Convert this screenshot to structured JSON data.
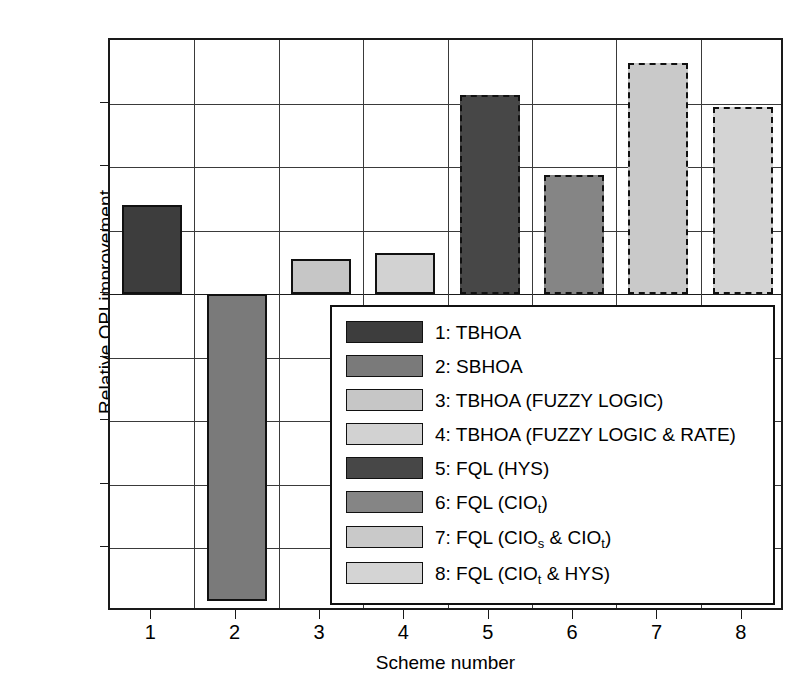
{
  "chart_data": {
    "type": "bar",
    "title": "",
    "xlabel": "Scheme number",
    "ylabel": "Relative OPI improvement",
    "categories": [
      "1",
      "2",
      "3",
      "4",
      "5",
      "6",
      "7",
      "8"
    ],
    "values": [
      0.141,
      -0.482,
      0.055,
      0.065,
      0.314,
      0.188,
      0.364,
      0.295
    ],
    "ylim": [
      -0.5,
      0.4
    ],
    "ytick_labels": [
      "0.4",
      "0.3",
      "0.2",
      "0.1",
      "0",
      "−0.1",
      "−0.2",
      "−0.3",
      "−0.4",
      "−0.5"
    ],
    "ytick_values": [
      0.4,
      0.3,
      0.2,
      0.1,
      0,
      -0.1,
      -0.2,
      -0.3,
      -0.4,
      -0.5
    ],
    "xtick_labels": [
      "1",
      "2",
      "3",
      "4",
      "5",
      "6",
      "7",
      "8"
    ],
    "grid": true,
    "legend_position": "inside-lower-right",
    "bar_styles": [
      {
        "fill": "#3d3d3d",
        "border": "solid"
      },
      {
        "fill": "#7a7a7a",
        "border": "solid"
      },
      {
        "fill": "#c6c6c6",
        "border": "solid"
      },
      {
        "fill": "#d2d2d2",
        "border": "solid"
      },
      {
        "fill": "#474747",
        "border": "dashed"
      },
      {
        "fill": "#858585",
        "border": "dashed"
      },
      {
        "fill": "#c9c9c9",
        "border": "dashed"
      },
      {
        "fill": "#d4d4d4",
        "border": "dashed"
      }
    ],
    "series": [
      {
        "name": "Relative OPI improvement",
        "values": [
          0.141,
          -0.482,
          0.055,
          0.065,
          0.314,
          0.188,
          0.364,
          0.295
        ]
      }
    ],
    "legend": [
      {
        "label": "1: TBHOA",
        "swatch": "#3d3d3d"
      },
      {
        "label": "2: SBHOA",
        "swatch": "#7a7a7a"
      },
      {
        "label": "3: TBHOA (FUZZY LOGIC)",
        "swatch": "#c6c6c6"
      },
      {
        "label": "4: TBHOA (FUZZY LOGIC & RATE)",
        "swatch": "#d2d2d2"
      },
      {
        "label": "5: FQL (HYS)",
        "swatch": "#474747"
      },
      {
        "label": "6: FQL (CIO_t)",
        "swatch": "#858585"
      },
      {
        "label": "7: FQL (CIO_s & CIO_t)",
        "swatch": "#c9c9c9"
      },
      {
        "label": "8: FQL (CIO_t & HYS)",
        "swatch": "#d4d4d4"
      }
    ]
  },
  "axes": {
    "ylabel": "Relative OPI improvement",
    "xlabel": "Scheme number",
    "yticks": [
      {
        "label": "0.4",
        "value": 0.4
      },
      {
        "label": "0.3",
        "value": 0.3
      },
      {
        "label": "0.2",
        "value": 0.2
      },
      {
        "label": "0.1",
        "value": 0.1
      },
      {
        "label": "0",
        "value": 0
      },
      {
        "label": "−0.1",
        "value": -0.1
      },
      {
        "label": "−0.2",
        "value": -0.2
      },
      {
        "label": "−0.3",
        "value": -0.3
      },
      {
        "label": "−0.4",
        "value": -0.4
      },
      {
        "label": "−0.5",
        "value": -0.5
      }
    ],
    "xticks": [
      {
        "label": "1"
      },
      {
        "label": "2"
      },
      {
        "label": "3"
      },
      {
        "label": "4"
      },
      {
        "label": "5"
      },
      {
        "label": "6"
      },
      {
        "label": "7"
      },
      {
        "label": "8"
      }
    ]
  },
  "legend": {
    "items": [
      {
        "num": "1",
        "text": "1: TBHOA",
        "pre": "1: TBHOA",
        "sub": "",
        "post": ""
      },
      {
        "num": "2",
        "text": "2: SBHOA",
        "pre": "2: SBHOA",
        "sub": "",
        "post": ""
      },
      {
        "num": "3",
        "text": "3: TBHOA (FUZZY LOGIC)",
        "pre": "3: TBHOA (FUZZY LOGIC)",
        "sub": "",
        "post": ""
      },
      {
        "num": "4",
        "text": "4: TBHOA (FUZZY LOGIC & RATE)",
        "pre": "4: TBHOA (FUZZY LOGIC & RATE)",
        "sub": "",
        "post": ""
      },
      {
        "num": "5",
        "text": "5: FQL (HYS)",
        "pre": "5: FQL (HYS)",
        "sub": "",
        "post": ""
      },
      {
        "num": "6",
        "text": "6: FQL (CIOt)",
        "pre": "6: FQL (CIO",
        "sub": "t",
        "post": ")"
      },
      {
        "num": "7",
        "text": "7: FQL (CIOs & CIOt)",
        "pre": "7: FQL (CIO",
        "sub": "s",
        "post": " & CIO"
      },
      {
        "num": "8",
        "text": "8: FQL (CIOt & HYS)",
        "pre": "8: FQL (CIO",
        "sub": "t",
        "post": " & HYS)"
      }
    ],
    "item7_sub2": "t",
    "item7_tail": ")"
  },
  "colors": {
    "axis": "#1a1a1a",
    "grid": "#3a3a3a",
    "background": "#ffffff"
  }
}
